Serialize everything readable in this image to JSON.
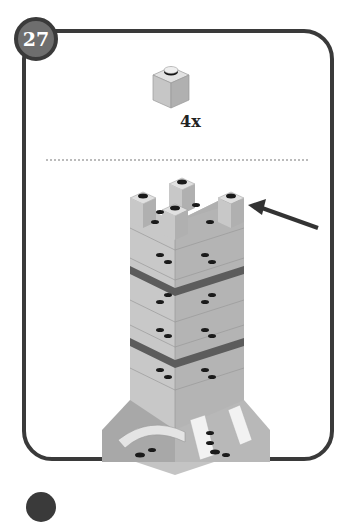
{
  "step": {
    "number": "27"
  },
  "parts_callout": {
    "items": [
      {
        "part": "brick-1x1",
        "color": "light-gray",
        "quantity": "4x"
      }
    ]
  },
  "illustration": {
    "subject": "tower-build-step",
    "arrow": "pointer-arrow-to-top-bricks"
  },
  "colors": {
    "frame": "#3a3a3a",
    "badge_fill": "#6e6e6e",
    "brick_light": "#c8c8c8",
    "brick_mid": "#a8a8a8",
    "band_dark": "#5c5c5c",
    "stud_dark": "#1a1a1a"
  }
}
